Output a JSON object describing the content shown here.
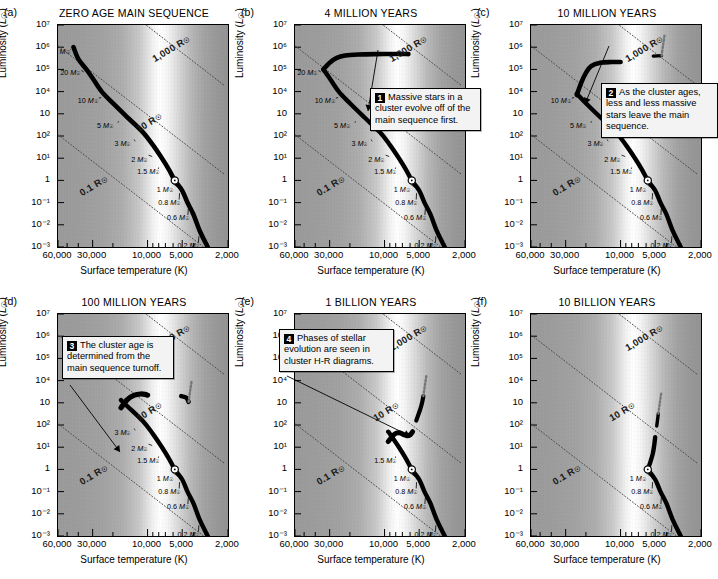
{
  "figure": {
    "axis": {
      "xlabel": "Surface temperature (K)",
      "ylabel_pre": "Luminosity (",
      "ylabel_sym": "L",
      "ylabel_sun": "☉",
      "ylabel_post": ")",
      "xticks": [
        "60,000",
        "30,000",
        "10,000",
        "5,000",
        "2,000"
      ],
      "yticks": [
        "10⁷",
        "10⁶",
        "10⁵",
        "10⁴",
        "10⁳",
        "10²",
        "10¹",
        "1",
        "10⁻¹",
        "10⁻²",
        "10⁻³"
      ],
      "xrange_K": [
        60000,
        2000
      ],
      "yrange_Lsun": [
        0.001,
        10000000
      ]
    },
    "radius_contours": [
      {
        "label": "1,000 R",
        "sun": "☉"
      },
      {
        "label": "10 R",
        "sun": "☉"
      },
      {
        "label": "0.1 R",
        "sun": "☉"
      }
    ],
    "mass_labels_full": [
      "60 M",
      "20 M",
      "10 M",
      "5 M",
      "3 M",
      "2 M",
      "1.5 M",
      "1 M",
      "0.8 M",
      "0.6 M",
      "0.2 M"
    ],
    "panels": [
      {
        "key": "a",
        "letter": "(a)",
        "title": "ZERO AGE MAIN SEQUENCE",
        "turnoff_mass": "none",
        "mass_labels": [
          "60 M",
          "20 M",
          "10 M",
          "5 M",
          "3 M",
          "2 M",
          "1.5 M",
          "1 M",
          "0.8 M",
          "0.6 M",
          "0.2 M"
        ],
        "callout": null
      },
      {
        "key": "b",
        "letter": "(b)",
        "title": "4 MILLION YEARS",
        "turnoff_mass": "20 M",
        "mass_labels": [
          "20 M",
          "10 M",
          "5 M",
          "3 M",
          "2 M",
          "1.5 M",
          "1 M",
          "0.8 M",
          "0.6 M",
          "0.2 M"
        ],
        "callout": {
          "num": "1",
          "text": "Massive stars in a cluster evolve off of the main sequence first."
        }
      },
      {
        "key": "c",
        "letter": "(c)",
        "title": "10 MILLION YEARS",
        "turnoff_mass": "10 M",
        "mass_labels": [
          "10 M",
          "5 M",
          "3 M",
          "2 M",
          "1.5 M",
          "1 M",
          "0.8 M",
          "0.6 M",
          "0.2 M"
        ],
        "callout": {
          "num": "2",
          "text": "As the cluster ages, less and less massive stars leave the main sequence."
        }
      },
      {
        "key": "d",
        "letter": "(d)",
        "title": "100 MILLION YEARS",
        "turnoff_mass": "5 M",
        "mass_labels": [
          "3 M",
          "2 M",
          "1.5 M",
          "1 M",
          "0.8 M",
          "0.6 M",
          "0.2 M"
        ],
        "callout": {
          "num": "3",
          "text": "The cluster age is determined from the main sequence turnoff."
        }
      },
      {
        "key": "e",
        "letter": "(e)",
        "title": "1 BILLION YEARS",
        "turnoff_mass": "2 M",
        "mass_labels": [
          "1.5 M",
          "1 M",
          "0.8 M",
          "0.6 M",
          "0.2 M"
        ],
        "callout": {
          "num": "4",
          "text": "Phases of stellar evolution are seen in cluster H-R diagrams."
        }
      },
      {
        "key": "f",
        "letter": "(f)",
        "title": "10 BILLION YEARS",
        "turnoff_mass": "1 M",
        "mass_labels": [
          "1 M",
          "0.8 M",
          "0.6 M",
          "0.2 M"
        ],
        "callout": null
      }
    ]
  },
  "chart_data": {
    "type": "line",
    "xlabel": "Surface temperature (K)",
    "ylabel": "Luminosity (L☉)",
    "xscale": "log-reversed",
    "yscale": "log",
    "xlim": [
      60000,
      2000
    ],
    "ylim": [
      0.001,
      10000000
    ],
    "xticks": [
      60000,
      30000,
      10000,
      5000,
      2000
    ],
    "yticks": [
      10000000.0,
      1000000.0,
      100000.0,
      10000.0,
      1000.0,
      100,
      10,
      1,
      0.1,
      0.01,
      0.001
    ],
    "grid": false,
    "legend": "none",
    "annotations": [
      "1 Massive stars in a cluster evolve off of the main sequence first.",
      "2 As the cluster ages, less and less massive stars leave the main sequence.",
      "3 The cluster age is determined from the main sequence turnoff.",
      "4 Phases of stellar evolution are seen in cluster H-R diagrams."
    ],
    "radius_lines_Rsun": [
      1000,
      10,
      0.1
    ],
    "sun_marker": {
      "temperature_K": 5800,
      "luminosity_Lsun": 1
    },
    "series": [
      {
        "name": "(a) Zero age main sequence",
        "age": "0",
        "turnoff_mass_Msun": null,
        "points_T_L": [
          [
            44000,
            1000000
          ],
          [
            40000,
            300000
          ],
          [
            34000,
            100000
          ],
          [
            30000,
            40000
          ],
          [
            25000,
            10000
          ],
          [
            20000,
            3000
          ],
          [
            15000,
            700
          ],
          [
            11000,
            150
          ],
          [
            9000,
            40
          ],
          [
            7500,
            10
          ],
          [
            6500,
            3
          ],
          [
            5800,
            1
          ],
          [
            5000,
            0.35
          ],
          [
            4500,
            0.1
          ],
          [
            4000,
            0.03
          ],
          [
            3500,
            0.005
          ],
          [
            3000,
            0.001
          ]
        ]
      },
      {
        "name": "(b) 4 million years",
        "age": "4 Myr",
        "turnoff_mass_Msun": 20,
        "points_T_L": [
          [
            30000,
            150000
          ],
          [
            26000,
            250000
          ],
          [
            22000,
            350000
          ],
          [
            18000,
            400000
          ],
          [
            14000,
            420000
          ],
          [
            10000,
            430000
          ],
          [
            7000,
            430000
          ],
          [
            5500,
            420000
          ]
        ]
      },
      {
        "name": "(c) 10 million years",
        "age": "10 Myr",
        "turnoff_mass_Msun": 10,
        "points_T_L": [
          [
            26000,
            30000
          ],
          [
            22000,
            70000
          ],
          [
            18000,
            120000
          ],
          [
            14000,
            140000
          ],
          [
            10000,
            140000
          ]
        ]
      },
      {
        "name": "(d) 100 million years",
        "age": "100 Myr",
        "turnoff_mass_Msun": 5,
        "points_T_L": [
          [
            14000,
            600
          ],
          [
            12000,
            1200
          ],
          [
            10000,
            1800
          ],
          [
            8500,
            2000
          ],
          [
            5000,
            2000
          ],
          [
            4200,
            1500
          ]
        ]
      },
      {
        "name": "(e) 1 billion years",
        "age": "1 Gyr",
        "turnoff_mass_Msun": 2,
        "points_T_L": [
          [
            7500,
            25
          ],
          [
            6800,
            40
          ],
          [
            6200,
            35
          ],
          [
            5600,
            40
          ],
          [
            5000,
            120
          ],
          [
            4600,
            400
          ],
          [
            4300,
            900
          ]
        ]
      },
      {
        "name": "(f) 10 billion years",
        "age": "10 Gyr",
        "turnoff_mass_Msun": 1,
        "points_T_L": [
          [
            5800,
            1
          ],
          [
            5400,
            2
          ],
          [
            5000,
            6
          ],
          [
            4800,
            30
          ],
          [
            4600,
            90
          ],
          [
            4400,
            200
          ]
        ]
      }
    ],
    "mass_ticks_Msun": [
      60,
      20,
      10,
      5,
      3,
      2,
      1.5,
      1,
      0.8,
      0.6,
      0.2
    ]
  }
}
